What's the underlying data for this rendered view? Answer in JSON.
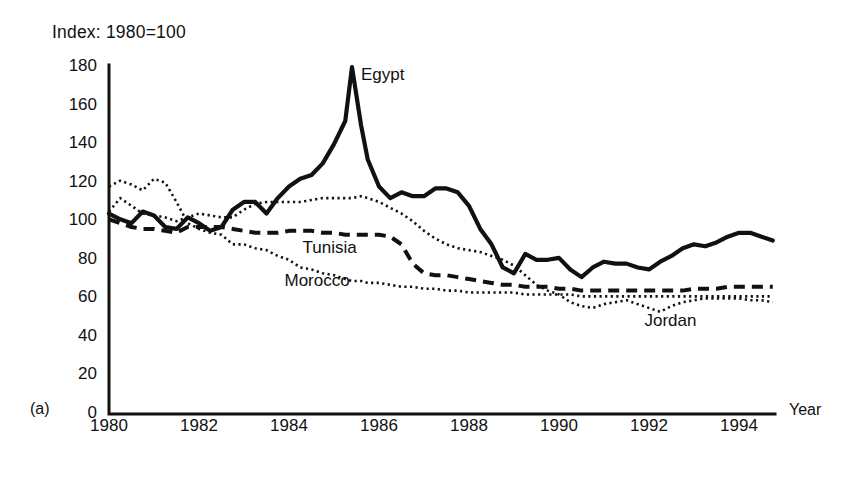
{
  "figure": {
    "panel_label": "(a)",
    "index_caption": "Index: 1980=100",
    "x_axis_title": "Year"
  },
  "chart_data": {
    "type": "line",
    "title": "Index: 1980=100",
    "xlabel": "Year",
    "ylabel": "",
    "xlim": [
      1980,
      1994.8
    ],
    "ylim": [
      0,
      180
    ],
    "yticks": [
      0,
      20,
      40,
      60,
      80,
      100,
      120,
      140,
      160,
      180
    ],
    "xticks": [
      1980,
      1982,
      1984,
      1986,
      1988,
      1990,
      1992,
      1994
    ],
    "grid": false,
    "legend": "inline-annotations",
    "annotations": [
      {
        "text": "Egypt",
        "x": 1985.6,
        "y": 176
      },
      {
        "text": "Tunisia",
        "x": 1984.3,
        "y": 86
      },
      {
        "text": "Morocco",
        "x": 1983.9,
        "y": 69
      },
      {
        "text": "Jordan",
        "x": 1991.9,
        "y": 48
      }
    ],
    "x": [
      1980,
      1980.25,
      1980.5,
      1980.75,
      1981,
      1981.25,
      1981.5,
      1981.75,
      1982,
      1982.25,
      1982.5,
      1982.75,
      1983,
      1983.25,
      1983.5,
      1983.75,
      1984,
      1984.25,
      1984.5,
      1984.75,
      1985,
      1985.25,
      1985.4,
      1985.6,
      1985.75,
      1986,
      1986.25,
      1986.5,
      1986.75,
      1987,
      1987.25,
      1987.5,
      1987.75,
      1988,
      1988.25,
      1988.5,
      1988.75,
      1989,
      1989.25,
      1989.5,
      1989.75,
      1990,
      1990.25,
      1990.5,
      1990.75,
      1991,
      1991.25,
      1991.5,
      1991.75,
      1992,
      1992.25,
      1992.5,
      1992.75,
      1993,
      1993.25,
      1993.5,
      1993.75,
      1994,
      1994.25,
      1994.5,
      1994.75
    ],
    "series": [
      {
        "name": "Egypt",
        "style": "solid",
        "values": [
          104,
          101,
          99,
          105,
          103,
          97,
          96,
          102,
          99,
          95,
          97,
          106,
          110,
          110,
          104,
          112,
          118,
          122,
          124,
          130,
          140,
          152,
          180,
          150,
          132,
          118,
          112,
          115,
          113,
          113,
          117,
          117,
          115,
          108,
          96,
          88,
          76,
          73,
          83,
          80,
          80,
          81,
          75,
          71,
          76,
          79,
          78,
          78,
          76,
          75,
          79,
          82,
          86,
          88,
          87,
          89,
          92,
          94,
          94,
          92,
          90
        ]
      },
      {
        "name": "Tunisia",
        "style": "dashed",
        "values": [
          101,
          99,
          97,
          96,
          96,
          95,
          94,
          97,
          97,
          97,
          97,
          96,
          95,
          94,
          94,
          94,
          95,
          95,
          95,
          94,
          94,
          93,
          93,
          93,
          93,
          93,
          92,
          88,
          78,
          73,
          72,
          72,
          71,
          70,
          69,
          68,
          67,
          67,
          66,
          66,
          66,
          65,
          65,
          64,
          64,
          64,
          64,
          64,
          64,
          64,
          64,
          64,
          64,
          65,
          65,
          65,
          66,
          66,
          66,
          66,
          66
        ]
      },
      {
        "name": "Morocco",
        "style": "dotted",
        "values": [
          118,
          121,
          119,
          116,
          122,
          120,
          110,
          99,
          96,
          94,
          93,
          88,
          88,
          86,
          85,
          82,
          80,
          76,
          75,
          73,
          72,
          70,
          69,
          69,
          68,
          68,
          67,
          66,
          66,
          65,
          65,
          64,
          64,
          63,
          63,
          63,
          63,
          63,
          62,
          62,
          62,
          62,
          62,
          61,
          61,
          61,
          61,
          61,
          61,
          61,
          61,
          61,
          61,
          61,
          61,
          61,
          61,
          61,
          61,
          61,
          61
        ]
      },
      {
        "name": "Jordan",
        "style": "dotted",
        "values": [
          105,
          112,
          108,
          104,
          103,
          102,
          100,
          102,
          104,
          103,
          102,
          102,
          106,
          109,
          110,
          110,
          110,
          110,
          111,
          112,
          112,
          112,
          112,
          113,
          112,
          110,
          107,
          104,
          100,
          95,
          91,
          88,
          86,
          85,
          84,
          82,
          80,
          77,
          72,
          67,
          64,
          62,
          58,
          56,
          55,
          57,
          58,
          59,
          57,
          55,
          53,
          56,
          58,
          59,
          60,
          60,
          60,
          60,
          59,
          59,
          58
        ]
      }
    ]
  },
  "yticks": [
    {
      "label": "180"
    },
    {
      "label": "160"
    },
    {
      "label": "140"
    },
    {
      "label": "120"
    },
    {
      "label": "100"
    },
    {
      "label": "80"
    },
    {
      "label": "60"
    },
    {
      "label": "40"
    },
    {
      "label": "20"
    },
    {
      "label": "0"
    }
  ],
  "xticks": [
    {
      "label": "1980"
    },
    {
      "label": "1982"
    },
    {
      "label": "1984"
    },
    {
      "label": "1986"
    },
    {
      "label": "1988"
    },
    {
      "label": "1990"
    },
    {
      "label": "1992"
    },
    {
      "label": "1994"
    }
  ]
}
